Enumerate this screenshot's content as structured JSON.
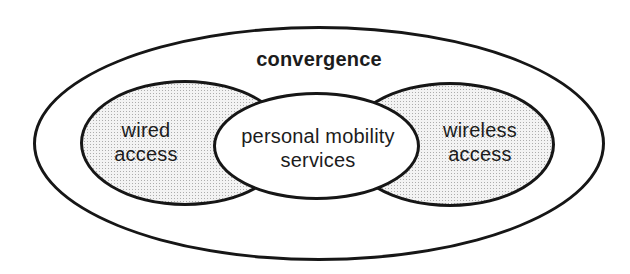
{
  "diagram": {
    "type": "venn-ellipse-diagram",
    "outer_label": "convergence",
    "left_ellipse": {
      "label_line1": "wired",
      "label_line2": "access",
      "fill_style": "halftone-dots"
    },
    "center_ellipse": {
      "label_line1": "personal mobility",
      "label_line2": "services",
      "fill_style": "solid-white"
    },
    "right_ellipse": {
      "label_line1": "wireless",
      "label_line2": "access",
      "fill_style": "halftone-dots"
    },
    "colors": {
      "background": "#ffffff",
      "stroke": "#161616",
      "text": "#1c1c1c",
      "shaded_fill": "#f3f3f3",
      "shaded_dot": "#adadad",
      "center_fill": "#ffffff"
    }
  }
}
